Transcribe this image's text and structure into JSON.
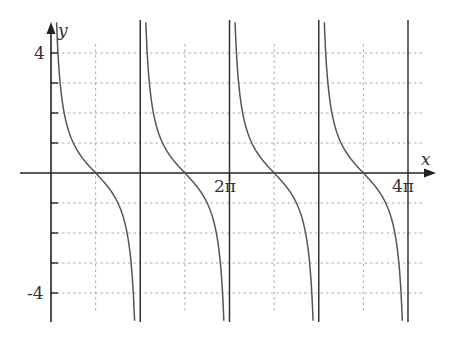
{
  "chart_data": {
    "type": "line",
    "title": "",
    "function": "cot(x)",
    "xlabel": "x",
    "ylabel": "y",
    "xlim": [
      0,
      12.566
    ],
    "ylim": [
      -4.9,
      5.0
    ],
    "x_tick_labels": [
      {
        "value": 6.2832,
        "label": "2π"
      },
      {
        "value": 12.5664,
        "label": "4π"
      }
    ],
    "y_tick_labels": [
      {
        "value": 4,
        "label": "4"
      },
      {
        "value": -4,
        "label": "-4"
      }
    ],
    "y_ticks": [
      -4,
      -3,
      -2,
      -1,
      1,
      2,
      3,
      4
    ],
    "x_grid_dotted": [
      1.5708,
      4.7124,
      7.854,
      10.9956
    ],
    "vertical_asymptotes": [
      3.1416,
      6.2832,
      9.4248,
      12.5664
    ],
    "zeros": [
      1.5708,
      4.7124,
      7.854,
      10.9956
    ],
    "grid": "dotted",
    "series": [
      {
        "name": "y = cot x",
        "periods": 4
      }
    ]
  },
  "labels": {
    "x_axis": "x",
    "y_axis": "y",
    "two_pi": "2π",
    "four_pi": "4π",
    "y_top": "4",
    "y_bottom": "-4"
  },
  "colors": {
    "curve": "#555555",
    "axis": "#222222",
    "grid": "#aaaaaa"
  }
}
